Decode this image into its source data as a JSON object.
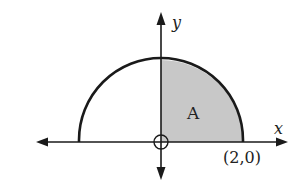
{
  "diagram": {
    "type": "semicircle-region",
    "axes": {
      "x_label": "x",
      "y_label": "y"
    },
    "region_label": "A",
    "point_label": "(2,0)",
    "colors": {
      "stroke": "#1a1a1a",
      "shade": "#c8c8c8",
      "background": "#ffffff"
    }
  }
}
